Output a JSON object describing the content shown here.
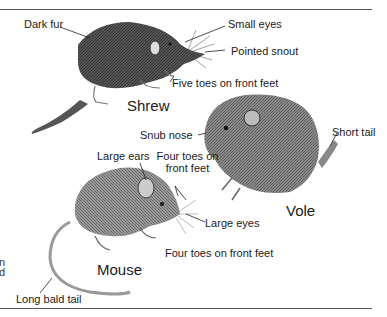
{
  "figure": {
    "animals": [
      {
        "name": "Shrew",
        "labels": [
          "Dark fur",
          "Small eyes",
          "Pointed snout",
          "Five toes on front feet"
        ]
      },
      {
        "name": "Vole",
        "labels": [
          "Snub nose",
          "Four toes on front feet",
          "Short tail"
        ]
      },
      {
        "name": "Mouse",
        "labels": [
          "Large ears",
          "Large eyes",
          "Four toes on front feet",
          "Long bald tail"
        ]
      }
    ],
    "cropped_text_fragments": [
      "n",
      "d"
    ],
    "colors": {
      "ink": "#1a1a1a",
      "rule": "#555555",
      "background": "#ffffff"
    }
  }
}
